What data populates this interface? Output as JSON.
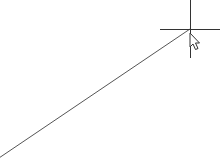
{
  "canvas": {
    "background": "#ffffff",
    "line": {
      "x1": 190,
      "y1": 29,
      "x2": -4,
      "y2": 160,
      "color": "#555555"
    },
    "crosshair": {
      "x": 190,
      "y": 29,
      "h_from": 160,
      "h_to": 220,
      "v_from": 0,
      "v_to": 58,
      "color": "#333333"
    },
    "cursor": {
      "type": "arrow-pointer",
      "x": 190,
      "y": 34
    }
  }
}
